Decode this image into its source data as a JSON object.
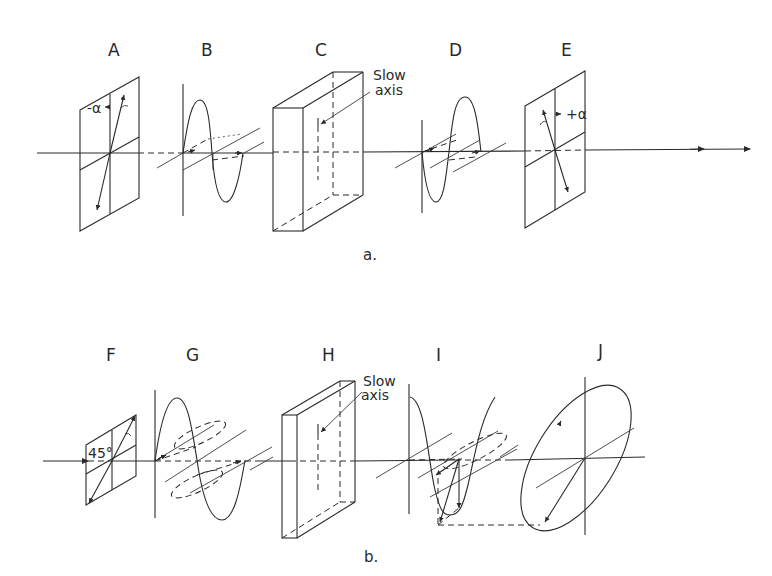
{
  "figure": {
    "panel_a": {
      "caption": "a.",
      "labels": [
        "A",
        "B",
        "C",
        "D",
        "E"
      ],
      "slow_axis_label": [
        "Slow",
        "axis"
      ],
      "angle_A": "-α",
      "angle_E": "+α"
    },
    "panel_b": {
      "caption": "b.",
      "labels": [
        "F",
        "G",
        "H",
        "I",
        "J"
      ],
      "slow_axis_label": [
        "Slow",
        "axis"
      ],
      "angle_F": "45°"
    }
  }
}
